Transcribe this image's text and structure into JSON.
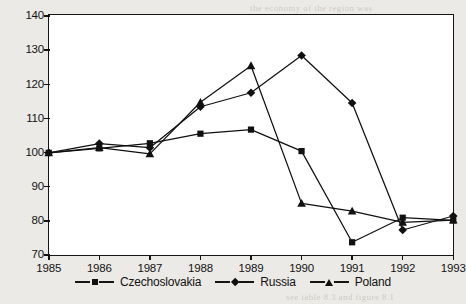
{
  "chart_data": {
    "type": "line",
    "title": "",
    "subtitle": "",
    "xlabel": "",
    "ylabel": "",
    "categories": [
      "1985",
      "1986",
      "1987",
      "1988",
      "1989",
      "1990",
      "1991",
      "1992",
      "1993"
    ],
    "x": [
      1985,
      1986,
      1987,
      1988,
      1989,
      1990,
      1991,
      1992,
      1993
    ],
    "xlim": [
      1985,
      1993
    ],
    "ylim": [
      70,
      140
    ],
    "yticks": [
      140,
      130,
      120,
      110,
      100,
      90,
      80,
      70
    ],
    "xticks": [
      "1985",
      "1986",
      "1987",
      "1988",
      "1989",
      "1990",
      "1991",
      "1992",
      "1993"
    ],
    "grid": false,
    "legend_position": "bottom",
    "series": [
      {
        "name": "Czechoslovakia",
        "marker": "square",
        "color": "#101010",
        "values": [
          100,
          101.3,
          102.8,
          105.6,
          106.8,
          100.5,
          73.8,
          81.0,
          80.2
        ]
      },
      {
        "name": "Russia",
        "marker": "diamond",
        "color": "#101010",
        "values": [
          100,
          102.7,
          101.5,
          113.5,
          117.6,
          128.5,
          114.6,
          77.4,
          81.5
        ]
      },
      {
        "name": "Poland",
        "marker": "triangle",
        "color": "#101010",
        "values": [
          100,
          101.5,
          99.7,
          114.8,
          125.5,
          85.2,
          82.9,
          79.6,
          80.3
        ]
      }
    ]
  },
  "legend": {
    "items": [
      {
        "label": "Czechoslovakia",
        "marker": "square"
      },
      {
        "label": "Russia",
        "marker": "diamond"
      },
      {
        "label": "Poland",
        "marker": "triangle"
      }
    ]
  },
  "axes": {
    "y_tick_labels": [
      "140",
      "130",
      "120",
      "110",
      "100",
      "90",
      "80",
      "70"
    ],
    "x_tick_labels": [
      "1985",
      "1986",
      "1987",
      "1988",
      "1989",
      "1990",
      "1991",
      "1992",
      "1993"
    ]
  },
  "colors": {
    "page_background": "#eceae6",
    "plot_background": "#ffffff",
    "axis": "#141414",
    "series": "#101010"
  },
  "bleed_text": [
    "the economy of the region was",
    "in transition and output fell",
    "sharply across the whole area",
    "in the years following 1989",
    "see table 8.3 and figure 8.1"
  ]
}
